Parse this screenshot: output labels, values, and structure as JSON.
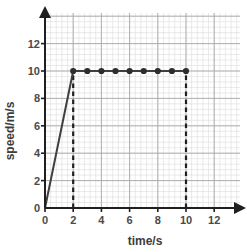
{
  "chart_data": {
    "type": "line",
    "title": "",
    "subtitle": "",
    "xlabel": "time/s",
    "ylabel": "speed/m/s",
    "xlim": [
      0,
      13.8
    ],
    "ylim": [
      0,
      13.2
    ],
    "xticks": [
      0,
      2,
      4,
      6,
      8,
      10,
      12
    ],
    "xtick_labels": [
      "0",
      "2",
      "4",
      "6",
      "8",
      "10",
      "12"
    ],
    "yticks": [
      0,
      2,
      4,
      6,
      8,
      10,
      12
    ],
    "ytick_labels": [
      "0",
      "2",
      "4",
      "6",
      "8",
      "10",
      "12"
    ],
    "grid": true,
    "grid_minor": true,
    "grid_minor_x_step": 0.4,
    "grid_minor_y_step": 0.4,
    "grid_major_step": 2,
    "legend": null,
    "legend_position": "none",
    "axis_arrows": true,
    "series": [
      {
        "name": "speed",
        "style": "solid",
        "color": "#3f3f3f",
        "x": [
          0,
          2,
          10
        ],
        "y": [
          0,
          10,
          10
        ]
      }
    ],
    "markers": {
      "shape": "circle",
      "color": "#2e2e2e",
      "x": [
        2,
        3,
        4,
        5,
        6,
        7,
        8,
        9,
        10
      ],
      "y": [
        10,
        10,
        10,
        10,
        10,
        10,
        10,
        10,
        10
      ]
    },
    "annotations": [
      {
        "kind": "dashed-vertical-line",
        "name": "dashed-line-t2",
        "x": 2,
        "y_from": 0,
        "y_to": 10,
        "color": "#1f1f1f"
      },
      {
        "kind": "dashed-vertical-line",
        "name": "dashed-line-t10",
        "x": 10,
        "y_from": 0,
        "y_to": 10,
        "color": "#1f1f1f"
      }
    ],
    "colors": {
      "line": "#3f3f3f",
      "marker": "#2e2e2e",
      "axis": "#1f1f1f",
      "grid_major": "#a8a8a8",
      "grid_minor": "#dcdcdc",
      "tick_text": "#4a4a4a",
      "background": "#ffffff"
    }
  }
}
